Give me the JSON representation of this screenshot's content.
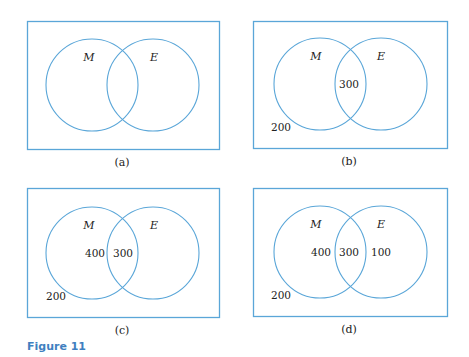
{
  "figure_label": "Figure 11",
  "colors": {
    "outline": "#5aa6d8",
    "figure_label": "#3f7fc0",
    "text": "#222222"
  },
  "panels": [
    {
      "caption": "(a)",
      "sets": [
        "M",
        "E"
      ],
      "regions": {
        "outside": "",
        "m_only": "",
        "both": "",
        "e_only": ""
      }
    },
    {
      "caption": "(b)",
      "sets": [
        "M",
        "E"
      ],
      "regions": {
        "outside": "200",
        "m_only": "",
        "both": "300",
        "e_only": ""
      }
    },
    {
      "caption": "(c)",
      "sets": [
        "M",
        "E"
      ],
      "regions": {
        "outside": "200",
        "m_only": "400",
        "both": "300",
        "e_only": ""
      }
    },
    {
      "caption": "(d)",
      "sets": [
        "M",
        "E"
      ],
      "regions": {
        "outside": "200",
        "m_only": "400",
        "both": "300",
        "e_only": "100"
      }
    }
  ]
}
